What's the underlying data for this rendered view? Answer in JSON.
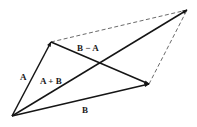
{
  "diagram": {
    "type": "vector-parallelogram",
    "points": {
      "origin": [
        12,
        116
      ],
      "tip_A": [
        51,
        42
      ],
      "tip_B": [
        149,
        84
      ],
      "tip_A_plus_B": [
        187,
        10
      ]
    },
    "vectors": [
      {
        "id": "A",
        "label": "A",
        "from": "origin",
        "to": "tip_A",
        "style": "solid-arrow"
      },
      {
        "id": "B",
        "label": "B",
        "from": "origin",
        "to": "tip_B",
        "style": "solid-arrow"
      },
      {
        "id": "A_plus_B",
        "label": "A + B",
        "from": "origin",
        "to": "tip_A_plus_B",
        "style": "solid-arrow"
      },
      {
        "id": "B_minus_A",
        "label": "B − A",
        "from": "tip_A",
        "to": "tip_B",
        "style": "solid-arrow"
      }
    ],
    "dashed_edges": [
      {
        "from": "tip_A",
        "to": "tip_A_plus_B"
      },
      {
        "from": "tip_B",
        "to": "tip_A_plus_B"
      }
    ],
    "labels": {
      "A": "A",
      "B": "B",
      "A_plus_B": "A + B",
      "B_minus_A": "B − A"
    },
    "colors": {
      "line": "#151515",
      "dashed": "#444444",
      "background": "#ffffff"
    }
  }
}
